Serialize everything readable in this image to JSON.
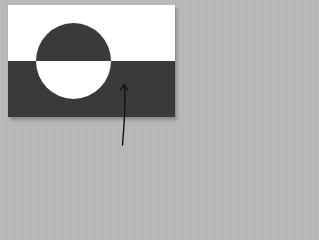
{
  "image": {
    "subject": "Flag of Greenland in grayscale with an annotation arrow",
    "background_color": "#b9b9b9",
    "flag": {
      "top_band_color": "#ffffff",
      "bottom_band_color": "#3a3a3a",
      "disc_top_color": "#3a3a3a",
      "disc_bottom_color": "#ffffff"
    },
    "arrow": {
      "color": "#111111",
      "points_to": "dark lower band of flag"
    }
  }
}
